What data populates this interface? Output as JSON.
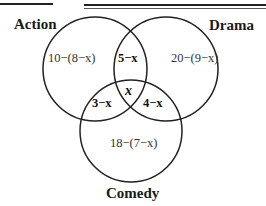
{
  "diagram": {
    "type": "venn",
    "sets": [
      {
        "name": "Action",
        "label": "Action"
      },
      {
        "name": "Drama",
        "label": "Drama"
      },
      {
        "name": "Comedy",
        "label": "Comedy"
      }
    ],
    "regions": {
      "action_only": "10−(8−x)",
      "drama_only": "20−(9−x)",
      "comedy_only": "18−(7−x)",
      "action_drama": "5−x",
      "action_comedy": "3−x",
      "drama_comedy": "4−x",
      "all_three": "x"
    },
    "stroke_color": "#222222"
  }
}
